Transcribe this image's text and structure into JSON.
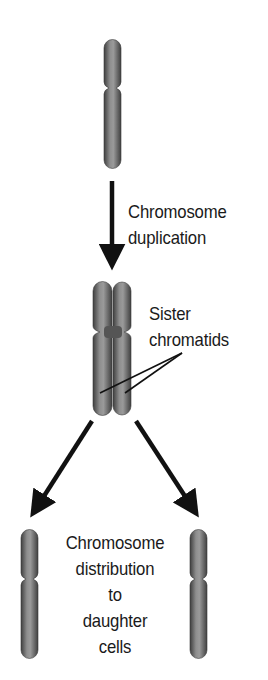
{
  "diagram": {
    "steps": [
      {
        "id": "original",
        "label_lines": []
      },
      {
        "id": "duplication",
        "label_lines": [
          "Chromosome",
          "duplication"
        ]
      },
      {
        "id": "sister",
        "label_lines": [
          "Sister",
          "chromatids"
        ]
      },
      {
        "id": "distribution",
        "label_lines": [
          "Chromosome",
          "distribution",
          "to",
          "daughter",
          "cells"
        ]
      }
    ],
    "labels": {
      "duplication": {
        "line1": "Chromosome",
        "line2": "duplication"
      },
      "sister": {
        "line1": "Sister",
        "line2": "chromatids"
      },
      "distribution": {
        "line1": "Chromosome",
        "line2": "distribution",
        "line3": "to",
        "line4": "daughter",
        "line5": "cells"
      }
    },
    "colors": {
      "chromosome_dark": "#4a4a4a",
      "chromosome_mid": "#7a7a7a",
      "chromosome_light": "#b5b5b5",
      "arrow": "#111111",
      "text": "#1a1a1a",
      "background": "#ffffff"
    }
  }
}
